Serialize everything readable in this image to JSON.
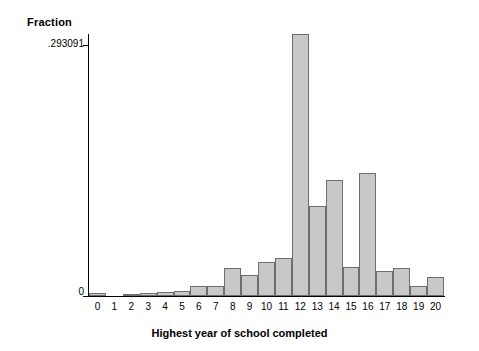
{
  "chart_data": {
    "type": "bar",
    "title": "",
    "xlabel": "Highest year of school completed",
    "ylabel": "Fraction",
    "categories": [
      "0",
      "1",
      "2",
      "3",
      "4",
      "5",
      "6",
      "7",
      "8",
      "9",
      "10",
      "11",
      "12",
      "13",
      "14",
      "15",
      "16",
      "17",
      "18",
      "19",
      "20"
    ],
    "values": [
      0.0035,
      0.0,
      0.0025,
      0.003,
      0.0045,
      0.006,
      0.0115,
      0.0115,
      0.031,
      0.0235,
      0.0375,
      0.0425,
      0.293091,
      0.1005,
      0.1295,
      0.0325,
      0.1375,
      0.0275,
      0.0315,
      0.0115,
      0.0215
    ],
    "ylim": [
      0,
      0.293091
    ],
    "xlim": [
      -0.5,
      20.5
    ],
    "ytick_labels": [
      ".293091",
      "0"
    ],
    "ytick_values": [
      0.293091,
      0
    ],
    "grid": false,
    "legend": false,
    "bar_color": "#c8c8c8",
    "bar_edge_color": "#6e6e6e"
  },
  "axes": {
    "y_title": "Fraction",
    "x_title": "Highest year of school completed",
    "y_max_label": ".293091",
    "y_min_label": "0"
  }
}
